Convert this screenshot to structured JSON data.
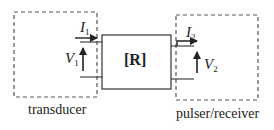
{
  "diagram": {
    "left_block": {
      "label": "transducer"
    },
    "center_block": {
      "label": "[R]",
      "symbol": "R"
    },
    "right_block": {
      "label": "pulser/receiver"
    },
    "port1": {
      "current": "I",
      "current_sub": "1",
      "voltage": "V",
      "voltage_sub": "1"
    },
    "port2": {
      "current": "I",
      "current_sub": "2",
      "voltage": "V",
      "voltage_sub": "2"
    },
    "colors": {
      "stroke": "#333333",
      "dashed": "#555555",
      "background": "#ffffff"
    }
  }
}
